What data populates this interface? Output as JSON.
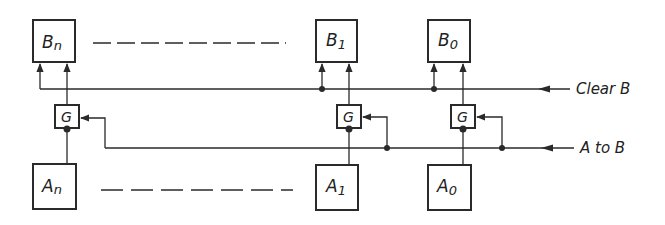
{
  "diagram": {
    "title": "",
    "registers_B": [
      {
        "id": "Bn",
        "label": "B",
        "sub": "n"
      },
      {
        "id": "B1",
        "label": "B",
        "sub": "1"
      },
      {
        "id": "B0",
        "label": "B",
        "sub": "0"
      }
    ],
    "registers_A": [
      {
        "id": "An",
        "label": "A",
        "sub": "n"
      },
      {
        "id": "A1",
        "label": "A",
        "sub": "1"
      },
      {
        "id": "A0",
        "label": "A",
        "sub": "0"
      }
    ],
    "gates": [
      {
        "id": "Gn",
        "label": "G"
      },
      {
        "id": "G1",
        "label": "G"
      },
      {
        "id": "G0",
        "label": "G"
      }
    ],
    "signals": {
      "clear_b": "Clear B",
      "a_to_b": "A to B"
    },
    "colors": {
      "line": "#2a2a2a",
      "background": "#ffffff"
    }
  }
}
